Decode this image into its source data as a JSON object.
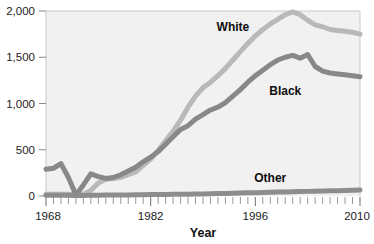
{
  "chart_data": {
    "type": "line",
    "title": "",
    "xlabel": "Year",
    "ylabel": "",
    "xlim": [
      1968,
      2010
    ],
    "ylim": [
      0,
      2000
    ],
    "grid": false,
    "legend_position": "inline-annotations",
    "x_tick_labels": [
      "1968",
      "1982",
      "1996",
      "2010"
    ],
    "x_tick_values": [
      1968,
      1982,
      1996,
      2010
    ],
    "y_tick_labels": [
      "0",
      "500",
      "1,000",
      "1,500",
      "2,000"
    ],
    "y_tick_values": [
      0,
      500,
      1000,
      1500,
      2000
    ],
    "minor_x_ticks_interval": 1,
    "x": [
      1968,
      1969,
      1970,
      1971,
      1972,
      1973,
      1974,
      1975,
      1976,
      1977,
      1978,
      1979,
      1980,
      1981,
      1982,
      1983,
      1984,
      1985,
      1986,
      1987,
      1988,
      1989,
      1990,
      1991,
      1992,
      1993,
      1994,
      1995,
      1996,
      1997,
      1998,
      1999,
      2000,
      2001,
      2002,
      2003,
      2004,
      2005,
      2006,
      2007,
      2008,
      2009,
      2010
    ],
    "series": [
      {
        "name": "White",
        "color": "#b9b9b9",
        "label_x": 1993,
        "label_y": 1780,
        "values": [
          20,
          20,
          20,
          20,
          10,
          20,
          60,
          140,
          180,
          190,
          200,
          230,
          260,
          330,
          400,
          490,
          600,
          700,
          820,
          960,
          1080,
          1170,
          1230,
          1300,
          1380,
          1470,
          1560,
          1650,
          1730,
          1800,
          1860,
          1910,
          1960,
          1990,
          1960,
          1900,
          1850,
          1830,
          1800,
          1790,
          1780,
          1770,
          1750
        ]
      },
      {
        "name": "Black",
        "color": "#888888",
        "label_x": 2000,
        "label_y": 1090,
        "values": [
          290,
          300,
          350,
          200,
          10,
          120,
          240,
          210,
          190,
          200,
          230,
          270,
          310,
          370,
          420,
          480,
          560,
          640,
          720,
          760,
          830,
          880,
          930,
          960,
          1010,
          1080,
          1150,
          1230,
          1300,
          1360,
          1420,
          1470,
          1500,
          1520,
          1490,
          1530,
          1400,
          1350,
          1330,
          1320,
          1310,
          1300,
          1290
        ]
      },
      {
        "name": "Other",
        "color": "#8d8d8d",
        "label_x": 1998,
        "label_y": 150,
        "values": [
          8,
          8,
          8,
          8,
          5,
          6,
          8,
          9,
          10,
          10,
          11,
          12,
          13,
          14,
          15,
          16,
          17,
          18,
          19,
          20,
          21,
          22,
          24,
          26,
          28,
          30,
          32,
          34,
          36,
          38,
          40,
          42,
          44,
          46,
          48,
          50,
          52,
          54,
          56,
          58,
          60,
          63,
          66
        ]
      }
    ]
  },
  "layout": {
    "plot_left": 46,
    "plot_right": 360,
    "plot_top": 11,
    "plot_bottom": 196,
    "plot_bg": "#f1f1f1",
    "frame_color": "#c9c9c9",
    "tick_color": "#7a7a7a",
    "line_width": 5
  }
}
